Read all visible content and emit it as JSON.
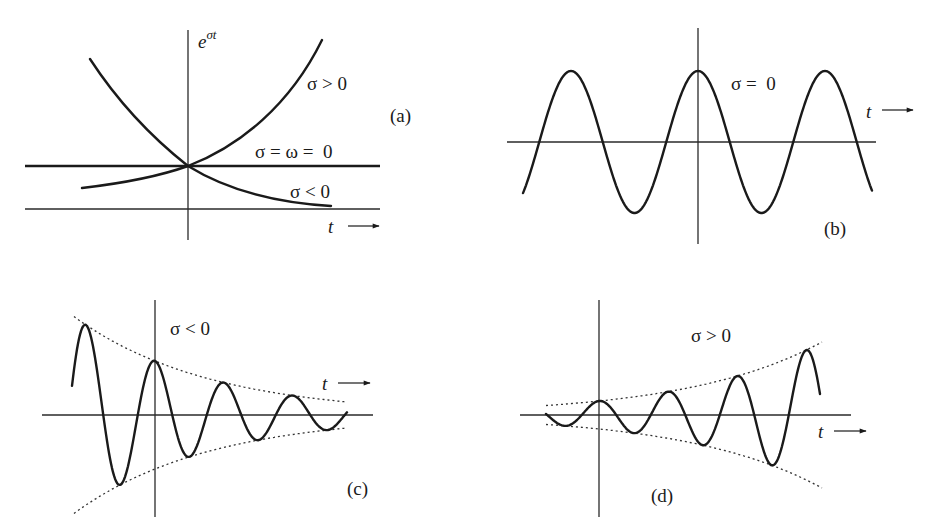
{
  "figure": {
    "panels": [
      {
        "id": "a",
        "label": "(a)",
        "y_axis_label_base": "e",
        "y_axis_label_exp": "σt",
        "x_axis_label": "t",
        "curve_labels": [
          "σ > 0",
          "σ = ω =  0",
          "σ < 0"
        ]
      },
      {
        "id": "b",
        "label": "(b)",
        "x_axis_label": "t",
        "curve_labels": [
          "σ =  0"
        ]
      },
      {
        "id": "c",
        "label": "(c)",
        "x_axis_label": "t",
        "curve_labels": [
          "σ < 0"
        ]
      },
      {
        "id": "d",
        "label": "(d)",
        "x_axis_label": "t",
        "curve_labels": [
          "σ > 0"
        ]
      }
    ]
  },
  "colors": {
    "ink": "#1a1a1a",
    "background": "#ffffff"
  }
}
